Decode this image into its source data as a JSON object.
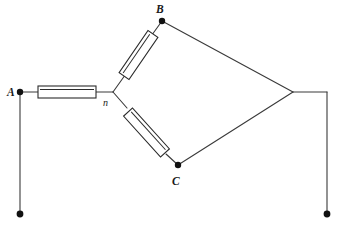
{
  "diagram": {
    "type": "electrical-schematic",
    "canvas": {
      "width": 339,
      "height": 228,
      "background": "#ffffff"
    },
    "colors": {
      "wire": "#3a3a3a",
      "component_outline": "#2b2b2b",
      "node_fill": "#111111",
      "background": "#ffffff"
    },
    "labels": [
      {
        "id": "label-a",
        "text": "A",
        "x": 8,
        "y": 96,
        "style": "italic-bold"
      },
      {
        "id": "label-b",
        "text": "B",
        "x": 157,
        "y": 13,
        "style": "italic-bold"
      },
      {
        "id": "label-c",
        "text": "C",
        "x": 173,
        "y": 184,
        "style": "italic-bold"
      },
      {
        "id": "label-n",
        "text": "n",
        "x": 103,
        "y": 105,
        "style": "italic-small"
      }
    ],
    "nodes": [
      {
        "id": "node-a",
        "label": "A",
        "x": 20,
        "y": 92,
        "radius": 3.2
      },
      {
        "id": "node-b",
        "label": "B",
        "x": 162,
        "y": 21,
        "radius": 3.2
      },
      {
        "id": "node-c",
        "label": "C",
        "x": 178,
        "y": 165,
        "radius": 3.2
      },
      {
        "id": "node-n",
        "label": "n",
        "x": 113,
        "y": 92,
        "radius": 0
      },
      {
        "id": "terminal-left",
        "label": "",
        "x": 20,
        "y": 214,
        "radius": 3.4
      },
      {
        "id": "terminal-right",
        "label": "",
        "x": 327,
        "y": 214,
        "radius": 3.4
      },
      {
        "id": "vertex-right",
        "label": "",
        "x": 293,
        "y": 92,
        "radius": 0
      }
    ],
    "components": [
      {
        "id": "resistor-an",
        "kind": "resistor",
        "between": [
          "A",
          "n"
        ],
        "orientation": "horizontal",
        "x1": 38,
        "y1": 92,
        "x2": 96,
        "y2": 92,
        "length": 58,
        "thickness": 12
      },
      {
        "id": "resistor-nb",
        "kind": "resistor",
        "between": [
          "n",
          "B"
        ],
        "orientation": "diagonal-up-right",
        "x1": 124,
        "y1": 76,
        "x2": 153,
        "y2": 34,
        "length": 51,
        "thickness": 12
      },
      {
        "id": "resistor-nc",
        "kind": "resistor",
        "between": [
          "n",
          "C"
        ],
        "orientation": "diagonal-down-right",
        "x1": 128,
        "y1": 112,
        "x2": 165,
        "y2": 153,
        "length": 55,
        "thickness": 12
      }
    ],
    "wires": [
      {
        "id": "wire-a-to-resistor",
        "points": "20,92 38,92"
      },
      {
        "id": "wire-resistor-to-n",
        "points": "96,92 113,92"
      },
      {
        "id": "wire-n-to-resistor-b",
        "points": "113,92 127,72"
      },
      {
        "id": "wire-resistor-b-to-b",
        "points": "150,38 162,21"
      },
      {
        "id": "wire-n-to-resistor-c",
        "points": "113,92 126,108"
      },
      {
        "id": "wire-resistor-c-to-c",
        "points": "167,155 178,165"
      },
      {
        "id": "wire-b-to-right-vertex",
        "points": "162,21 293,92"
      },
      {
        "id": "wire-c-to-right-vertex",
        "points": "178,165 293,92"
      },
      {
        "id": "wire-right-horizontal",
        "points": "293,92 327,92"
      },
      {
        "id": "wire-right-vertical",
        "points": "327,92 327,214"
      },
      {
        "id": "wire-left-vertical",
        "points": "20,92 20,214"
      }
    ]
  }
}
